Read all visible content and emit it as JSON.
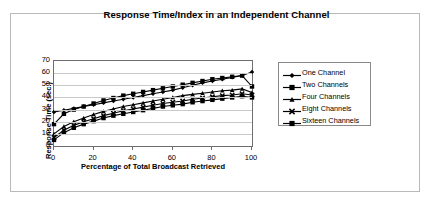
{
  "chart_data": {
    "type": "line",
    "title": "Response Time/Index in an Independent Channel",
    "xlabel": "Percentage of Total Broadcast Retrieved",
    "ylabel": "Response Time (sec.)",
    "xlim": [
      0,
      100
    ],
    "ylim": [
      0,
      70
    ],
    "xticks": [
      0,
      20,
      40,
      60,
      80,
      100
    ],
    "yticks": [
      0,
      10,
      20,
      30,
      40,
      50,
      60,
      70
    ],
    "grid": "horizontal",
    "legend_position": "right",
    "x": [
      0,
      5,
      10,
      15,
      20,
      25,
      30,
      35,
      40,
      45,
      50,
      55,
      60,
      65,
      70,
      75,
      80,
      85,
      90,
      95,
      100
    ],
    "series": [
      {
        "name": "One Channel",
        "marker": "diamond",
        "values": [
          28,
          29.5,
          31,
          32.5,
          34,
          35.5,
          37,
          38.5,
          40,
          41.5,
          43,
          44.5,
          46,
          48,
          50,
          52,
          53.5,
          55,
          56.5,
          58,
          61
        ]
      },
      {
        "name": "Two Channels",
        "marker": "square",
        "values": [
          18,
          26.5,
          30,
          32.5,
          35,
          37.5,
          39.5,
          41.5,
          43,
          44.5,
          46,
          47.5,
          49,
          50.5,
          52,
          53.5,
          55,
          56,
          57,
          58,
          49
        ]
      },
      {
        "name": "Four Channels",
        "marker": "triangle",
        "values": [
          10,
          16,
          20,
          23,
          26,
          28.5,
          30.5,
          32.5,
          34,
          35.5,
          37,
          38.5,
          40,
          41.5,
          42.5,
          43.5,
          44.5,
          45.5,
          46,
          47,
          44
        ]
      },
      {
        "name": "Eight Channels",
        "marker": "x-cross",
        "values": [
          7,
          13,
          17,
          20,
          22.5,
          25,
          27,
          29,
          30.5,
          32,
          33.5,
          35,
          36,
          37,
          38.5,
          39.5,
          40.5,
          41.5,
          42,
          43,
          42
        ]
      },
      {
        "name": "Sixteen Channels",
        "marker": "square",
        "values": [
          5,
          11,
          15,
          18,
          20.5,
          23,
          25,
          26.5,
          28,
          29.5,
          31,
          32.5,
          33.5,
          34.5,
          36,
          37,
          38,
          39,
          40,
          41,
          40
        ]
      }
    ]
  }
}
